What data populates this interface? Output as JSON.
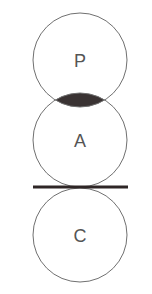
{
  "diagram": {
    "circles": [
      {
        "id": "P",
        "label": "P",
        "cx": 80,
        "cy": 60,
        "r": 47
      },
      {
        "id": "A",
        "label": "A",
        "cx": 80,
        "cy": 140,
        "r": 47
      },
      {
        "id": "C",
        "label": "C",
        "cx": 80,
        "cy": 235,
        "r": 47
      }
    ],
    "overlap": {
      "between": [
        "P",
        "A"
      ],
      "fill": "#3a3333"
    },
    "separator_line": {
      "y": 187,
      "x1": 33,
      "x2": 128,
      "color": "#2e2626"
    },
    "colors": {
      "circle_stroke": "#707070",
      "label": "#555555",
      "background": "#ffffff"
    }
  }
}
